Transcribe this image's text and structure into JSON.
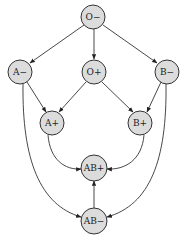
{
  "diagram": {
    "type": "directed-graph",
    "node_fill": "#dcdcdc",
    "stroke": "#333333",
    "nodes": [
      {
        "id": "o_neg",
        "label": "O−",
        "x": 93,
        "y": 17
      },
      {
        "id": "a_neg",
        "label": "A−",
        "x": 20,
        "y": 72
      },
      {
        "id": "o_pos",
        "label": "O+",
        "x": 94,
        "y": 72
      },
      {
        "id": "b_neg",
        "label": "B−",
        "x": 167,
        "y": 72
      },
      {
        "id": "a_pos",
        "label": "A+",
        "x": 52,
        "y": 123
      },
      {
        "id": "b_pos",
        "label": "B+",
        "x": 140,
        "y": 123
      },
      {
        "id": "ab_pos",
        "label": "AB+",
        "x": 94,
        "y": 168
      },
      {
        "id": "ab_neg",
        "label": "AB−",
        "x": 94,
        "y": 221
      }
    ],
    "edges": [
      {
        "from": "O−",
        "to": "A−"
      },
      {
        "from": "O−",
        "to": "O+"
      },
      {
        "from": "O−",
        "to": "B−"
      },
      {
        "from": "A−",
        "to": "A+"
      },
      {
        "from": "O+",
        "to": "A+"
      },
      {
        "from": "O+",
        "to": "B+"
      },
      {
        "from": "B−",
        "to": "B+"
      },
      {
        "from": "A+",
        "to": "AB+"
      },
      {
        "from": "B+",
        "to": "AB+"
      },
      {
        "from": "A−",
        "to": "AB−"
      },
      {
        "from": "B−",
        "to": "AB−"
      },
      {
        "from": "AB−",
        "to": "AB+"
      }
    ]
  }
}
